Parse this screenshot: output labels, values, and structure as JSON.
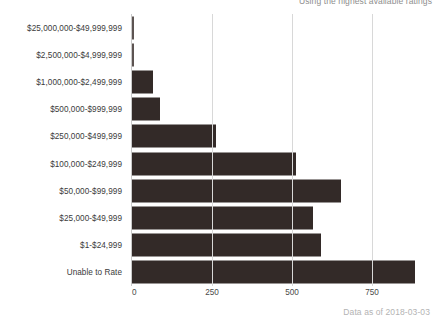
{
  "subtitle": "Using the highest available ratings",
  "footer": "Data as of 2018-03-03",
  "colors": {
    "bar": "#332a28",
    "gridline": "#d8d8d8",
    "axis": "#c9c9c9",
    "label": "#3b3b3b",
    "subtitle": "#8e8e8e",
    "footer": "#b3b3b3",
    "background": "#ffffff"
  },
  "chart_data": {
    "type": "bar",
    "orientation": "horizontal",
    "title": "",
    "subtitle": "Using the highest available ratings",
    "xlabel": "",
    "ylabel": "",
    "xlim": [
      0,
      1000
    ],
    "xticks": [
      0,
      250,
      500,
      750
    ],
    "xtick_labels": [
      "0",
      "250",
      "500",
      "750"
    ],
    "grid": true,
    "grid_axis": "x",
    "legend": false,
    "annotation": "Data as of 2018-03-03",
    "categories": [
      "$25,000,000-$49,999,999",
      "$2,500,000-$4,999,999",
      "$1,000,000-$2,499,999",
      "$500,000-$999,999",
      "$250,000-$499,999",
      "$100,000-$249,999",
      "$50,000-$99,999",
      "$25,000-$49,999",
      "$1-$24,999",
      "Unable to Rate"
    ],
    "values": [
      3,
      6,
      65,
      88,
      262,
      512,
      653,
      566,
      591,
      884
    ]
  }
}
